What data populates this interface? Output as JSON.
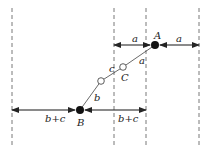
{
  "diagram": {
    "dashed_lines_x": [
      12,
      114,
      146,
      199
    ],
    "points": {
      "A": {
        "label": "A",
        "x": 155,
        "y": 45,
        "type": "filled"
      },
      "B": {
        "label": "B",
        "x": 80,
        "y": 110,
        "type": "filled"
      },
      "C1": {
        "x": 101,
        "y": 81,
        "type": "open"
      },
      "C2": {
        "x": 123,
        "y": 67,
        "type": "open"
      }
    },
    "labels": {
      "A": "A",
      "B": "B",
      "C": "C",
      "seg_a": "a",
      "seg_b": "b",
      "seg_c": "c",
      "top_left_a": "a",
      "top_right_a": "a",
      "bottom_left_bc": "b+c",
      "bottom_right_bc": "b+c"
    },
    "dimensions": [
      {
        "label": "a",
        "from_x": 114,
        "to_x": 150,
        "y": 45
      },
      {
        "label": "a",
        "from_x": 160,
        "to_x": 199,
        "y": 45
      },
      {
        "label": "b+c",
        "from_x": 12,
        "to_x": 75,
        "y": 110
      },
      {
        "label": "b+c",
        "from_x": 85,
        "to_x": 146,
        "y": 110
      }
    ]
  }
}
